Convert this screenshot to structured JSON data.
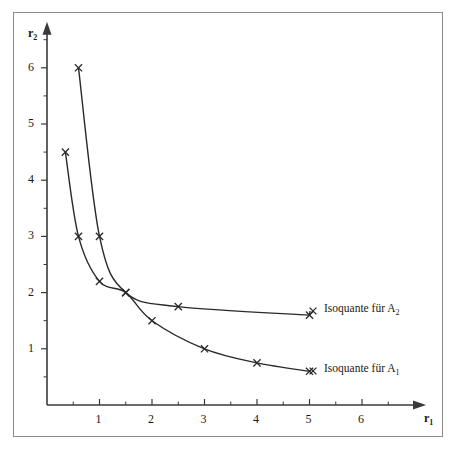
{
  "chart_data": {
    "type": "line",
    "title": "",
    "xlabel": "r1",
    "ylabel": "r2",
    "xlabel_display": "r",
    "xlabel_sub": "1",
    "ylabel_display": "r",
    "ylabel_sub": "2",
    "xlim": [
      0,
      7.2
    ],
    "ylim": [
      0,
      6.8
    ],
    "xticks": [
      1,
      2,
      3,
      4,
      5,
      6
    ],
    "yticks": [
      1,
      2,
      3,
      4,
      5,
      6
    ],
    "xminor": [
      0.5,
      1.5,
      2.5,
      3.5,
      4.5,
      5.5,
      6.5
    ],
    "yminor": [
      0.5,
      1.5,
      2.5,
      3.5,
      4.5,
      5.5,
      6.5
    ],
    "grid": false,
    "legend_position": "right-inside",
    "marker": "x",
    "line_color": "#2a2a2a",
    "axis_color": "#3a3a3a",
    "frame_color": "#8a8a8a",
    "series": [
      {
        "name": "Isoquante für A2",
        "label_text": "Isoquante für A",
        "label_sub": "2",
        "points": [
          {
            "x": 0.6,
            "y": 6.0
          },
          {
            "x": 1.0,
            "y": 3.0
          },
          {
            "x": 1.5,
            "y": 2.0
          },
          {
            "x": 2.5,
            "y": 1.75
          },
          {
            "x": 5.0,
            "y": 1.6
          }
        ]
      },
      {
        "name": "Isoquante für A1",
        "label_text": "Isoquante für A",
        "label_sub": "1",
        "points": [
          {
            "x": 0.35,
            "y": 4.5
          },
          {
            "x": 0.6,
            "y": 3.0
          },
          {
            "x": 1.0,
            "y": 2.2
          },
          {
            "x": 1.5,
            "y": 2.0
          },
          {
            "x": 2.0,
            "y": 1.5
          },
          {
            "x": 3.0,
            "y": 1.0
          },
          {
            "x": 4.0,
            "y": 0.75
          },
          {
            "x": 5.0,
            "y": 0.6
          }
        ]
      }
    ]
  },
  "labels": {
    "x_ticks": [
      "1",
      "2",
      "3",
      "4",
      "5",
      "6"
    ],
    "y_ticks": [
      "1",
      "2",
      "3",
      "4",
      "5",
      "6"
    ],
    "y_axis_title": "r",
    "y_axis_sub": "2",
    "x_axis_title": "r",
    "x_axis_sub": "1",
    "legend_a2": "Isoquante für A",
    "legend_a2_sub": "2",
    "legend_a1": "Isoquante für A",
    "legend_a1_sub": "1"
  }
}
